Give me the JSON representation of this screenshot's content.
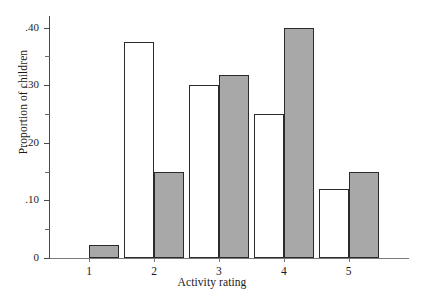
{
  "chart_data": {
    "type": "bar",
    "title": "",
    "xlabel": "Activity rating",
    "ylabel": "Proportion of children",
    "categories": [
      "1",
      "2",
      "3",
      "4",
      "5"
    ],
    "series": [
      {
        "name": "open",
        "style": "open",
        "values": [
          0.0,
          0.375,
          0.3,
          0.25,
          0.12
        ]
      },
      {
        "name": "filled",
        "style": "filled",
        "values": [
          0.022,
          0.15,
          0.317,
          0.4,
          0.15
        ]
      }
    ],
    "ylim": [
      0,
      0.42
    ],
    "yticks": [
      0,
      0.1,
      0.2,
      0.3,
      0.4
    ],
    "ytick_labels": [
      "0",
      ".10",
      ".20",
      ".30",
      ".40"
    ],
    "yminor_ticks": [
      0.05,
      0.15,
      0.25,
      0.35
    ],
    "grid": false,
    "legend": "none",
    "colors": {
      "open_fill": "#ffffff",
      "filled_fill": "#a8a8a8",
      "bar_edge": "#2b2b2b",
      "axis": "#4a4a4a",
      "background": "#ffffff"
    }
  }
}
